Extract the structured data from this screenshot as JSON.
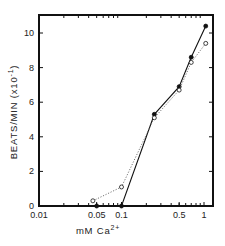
{
  "chart_data": {
    "type": "line",
    "title": "",
    "xlabel": "mM Ca2+",
    "xlabel_parts": {
      "base": "mM  Ca",
      "sup": "2+"
    },
    "ylabel": "BEATS/MIN (x10-1)",
    "ylabel_parts": {
      "base": "BEATS/MIN  (x10",
      "sup": "-1",
      "end": ")"
    },
    "xscale": "log",
    "xlim": [
      0.01,
      1.2
    ],
    "ylim": [
      0,
      11
    ],
    "x_ticks": [
      {
        "value": 0.01,
        "label": "0.01"
      },
      {
        "value": 0.05,
        "label": "0.05"
      },
      {
        "value": 0.1,
        "label": "0.1"
      },
      {
        "value": 0.5,
        "label": "0.5"
      },
      {
        "value": 1,
        "label": "1"
      }
    ],
    "x_minor_ticks": [
      0.02,
      0.03,
      0.04,
      0.05,
      0.06,
      0.07,
      0.08,
      0.09,
      0.2,
      0.3,
      0.4,
      0.5,
      0.6,
      0.7,
      0.8,
      0.9
    ],
    "y_ticks": [
      {
        "value": 0,
        "label": "0"
      },
      {
        "value": 2,
        "label": "2"
      },
      {
        "value": 4,
        "label": "4"
      },
      {
        "value": 6,
        "label": "6"
      },
      {
        "value": 8,
        "label": "8"
      },
      {
        "value": 10,
        "label": "10"
      }
    ],
    "grid": false,
    "legend": null,
    "series": [
      {
        "name": "filled circles (solid line)",
        "marker": "filled-circle",
        "line": "solid",
        "x": [
          0.05,
          0.1,
          0.25,
          0.5,
          0.7,
          1.05
        ],
        "y": [
          0,
          0,
          5.3,
          6.9,
          8.6,
          10.4
        ]
      },
      {
        "name": "open circles (dotted line)",
        "marker": "open-circle",
        "line": "dotted",
        "x": [
          0.045,
          0.1,
          0.25,
          0.5,
          0.7,
          1.05
        ],
        "y": [
          0.3,
          1.1,
          5.1,
          6.7,
          8.3,
          9.4
        ]
      }
    ]
  },
  "colors": {
    "ink": "#111111",
    "dotted_line": "#777777"
  }
}
